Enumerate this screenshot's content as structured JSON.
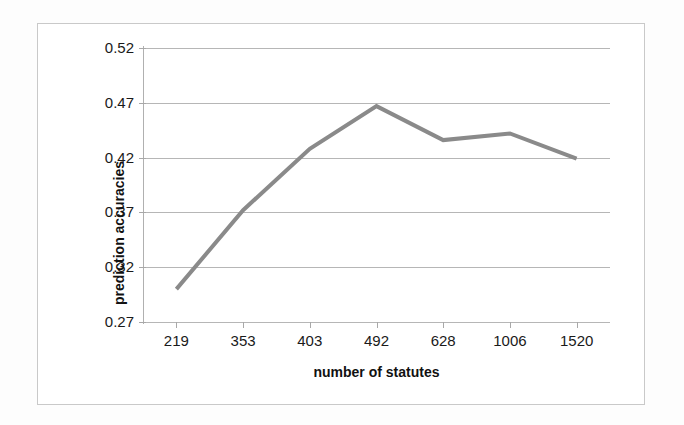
{
  "chart_data": {
    "type": "line",
    "title": "",
    "subtitle": "",
    "xlabel": "number of statutes",
    "ylabel": "prediction accuracies",
    "categories": [
      "219",
      "353",
      "403",
      "492",
      "628",
      "1006",
      "1520"
    ],
    "values": [
      0.3,
      0.372,
      0.428,
      0.467,
      0.436,
      0.442,
      0.419
    ],
    "series": [
      {
        "name": "prediction accuracy",
        "values": [
          0.3,
          0.372,
          0.428,
          0.467,
          0.436,
          0.442,
          0.419
        ],
        "color": "#8a8a8a"
      }
    ],
    "ylim": [
      0.27,
      0.52
    ],
    "y_ticks": [
      0.27,
      0.32,
      0.37,
      0.42,
      0.47,
      0.52
    ],
    "y_tick_labels": [
      "0.27",
      "0.32",
      "0.37",
      "0.42",
      "0.47",
      "0.52"
    ],
    "grid": true,
    "grid_axis": "y",
    "legend": false,
    "legend_position": "none",
    "markers": false,
    "line_color": "#8a8a8a",
    "grid_color": "#b6b6b6",
    "background_color": "#ffffff",
    "border_color": "#c9c9c9",
    "text_color": "#1a1a1a",
    "annotations": []
  },
  "axes": {
    "y_title": "prediction accuracies",
    "x_title": "number of statutes"
  }
}
